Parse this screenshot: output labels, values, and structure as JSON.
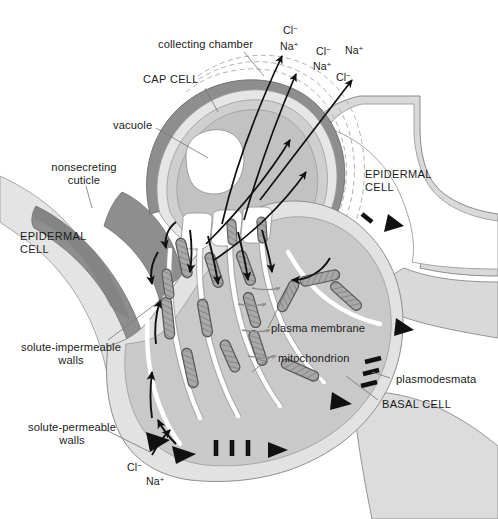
{
  "figure": {
    "background_color": "#ffffff"
  },
  "palette": {
    "cuticle_dark": "#8e8e8e",
    "cuticle_darker": "#7c7c7c",
    "wall_light": "#e2e2e2",
    "wall_mid": "#d3d3d3",
    "cytoplasm": "#c9c9c9",
    "cap_cell_fill": "#cfcfcf",
    "vacuole_fill": "#ffffff",
    "mitochondrion_fill": "#a8a8a8",
    "mitochondrion_stroke": "#555555",
    "plasmodesma_black": "#111111",
    "arrow_black": "#111111",
    "leader_gray": "#6f6f6f",
    "text_color": "#1b1b1b",
    "dashed_chamber": "#b3b3b3",
    "membrane_white": "#ffffff"
  },
  "labels": {
    "collecting_chamber": "collecting chamber",
    "cap_cell": "CAP CELL",
    "vacuole": "vacuole",
    "nonsecreting_cuticle_line1": "nonsecreting",
    "nonsecreting_cuticle_line2": "cuticle",
    "epidermal_cell_left_line1": "EPIDERMAL",
    "epidermal_cell_left_line2": "CELL",
    "epidermal_cell_right_line1": "EPIDERMAL",
    "epidermal_cell_right_line2": "CELL",
    "solute_impermeable_line1": "solute-impermeable",
    "solute_impermeable_line2": "walls",
    "solute_permeable_line1": "solute-permeable",
    "solute_permeable_line2": "walls",
    "plasma_membrane": "plasma membrane",
    "mitochondrion": "mitochondrion",
    "plasmodesmata": "plasmodesmata",
    "basal_cell": "BASAL CELL"
  },
  "ions": {
    "chloride_symbol": "Cl",
    "chloride_charge": "−",
    "sodium_symbol": "Na",
    "sodium_charge": "+",
    "top_group": [
      {
        "id": "cl-1",
        "species": "Cl",
        "charge": "−",
        "x": 283,
        "y": 22
      },
      {
        "id": "na-1",
        "species": "Na",
        "charge": "+",
        "x": 280,
        "y": 38
      },
      {
        "id": "cl-2",
        "species": "Cl",
        "charge": "−",
        "x": 316,
        "y": 43
      },
      {
        "id": "na-2",
        "species": "Na",
        "charge": "+",
        "x": 345,
        "y": 42
      },
      {
        "id": "na-3",
        "species": "Na",
        "charge": "+",
        "x": 313,
        "y": 58
      },
      {
        "id": "cl-3",
        "species": "Cl",
        "charge": "−",
        "x": 336,
        "y": 69
      }
    ],
    "bottom_group": [
      {
        "id": "cl-b1",
        "species": "Cl",
        "charge": "−",
        "x": 127,
        "y": 459
      },
      {
        "id": "na-b1",
        "species": "Na",
        "charge": "+",
        "x": 146,
        "y": 473
      }
    ]
  },
  "structures": {
    "cap_cell": "cap cell with large central vacuole",
    "collecting_chamber": "sub-cuticular collecting chamber bounded by dashed lines",
    "basal_cell": "basal transfer cell with wall ingrowths and mitochondria",
    "epidermal_cells": 2,
    "neck_cells": 3,
    "mitochondria_count": 16,
    "plasmodesmata_groups": 3,
    "secretion_arrows": 4,
    "cytoplasm_flow_arrows": 11
  }
}
